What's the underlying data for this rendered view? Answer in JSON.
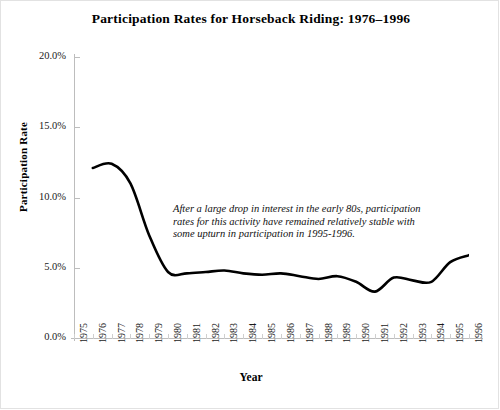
{
  "chart_data": {
    "type": "line",
    "title": "Participation Rates for Horseback Riding: 1976–1996",
    "xlabel": "Year",
    "ylabel": "Participation Rate",
    "xlim": [
      1975,
      1996
    ],
    "ylim": [
      0,
      20
    ],
    "grid": false,
    "legend": "none",
    "line_color": "#000000",
    "axis_color": "#bdbdbd",
    "y_ticks": [
      "0.0%",
      "5.0%",
      "10.0%",
      "15.0%",
      "20.0%"
    ],
    "y_tick_values": [
      0,
      5,
      10,
      15,
      20
    ],
    "x_ticks": [
      "1975",
      "1976",
      "1977",
      "1978",
      "1979",
      "1980",
      "1981",
      "1982",
      "1983",
      "1984",
      "1985",
      "1986",
      "1987",
      "1988",
      "1989",
      "1990",
      "1991",
      "1992",
      "1993",
      "1994",
      "1995",
      "1996"
    ],
    "x": [
      1976,
      1977,
      1978,
      1979,
      1980,
      1981,
      1982,
      1983,
      1984,
      1985,
      1986,
      1987,
      1988,
      1989,
      1990,
      1991,
      1992,
      1993,
      1994,
      1995,
      1996
    ],
    "values": [
      12.1,
      12.4,
      11.0,
      7.3,
      4.7,
      4.6,
      4.7,
      4.8,
      4.6,
      4.5,
      4.6,
      4.4,
      4.2,
      4.4,
      4.0,
      3.3,
      4.3,
      4.1,
      4.0,
      5.4,
      5.9
    ],
    "series": [
      {
        "name": "Horseback Riding",
        "values": [
          12.1,
          12.4,
          11.0,
          7.3,
          4.7,
          4.6,
          4.7,
          4.8,
          4.6,
          4.5,
          4.6,
          4.4,
          4.2,
          4.4,
          4.0,
          3.3,
          4.3,
          4.1,
          4.0,
          5.4,
          5.9
        ]
      }
    ],
    "annotation": {
      "line1": "After a large drop in interest in the early 80s, participation",
      "line2": "rates for this activity have remained relatively stable with",
      "line3": "some upturn in participation in 1995-1996."
    }
  }
}
